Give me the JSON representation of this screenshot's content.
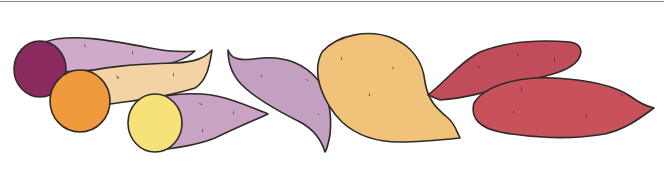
{
  "illustration": {
    "subject": "Assorted sweet potatoes watercolor illustration",
    "items": [
      {
        "name": "purple-sweet-potato-cut",
        "flesh": "purple"
      },
      {
        "name": "orange-sweet-potato-cut",
        "flesh": "orange"
      },
      {
        "name": "yellow-sweet-potato-cut",
        "flesh": "yellow"
      },
      {
        "name": "lavender-sweet-potato-whole"
      },
      {
        "name": "yellow-potato-whole"
      },
      {
        "name": "red-sweet-potato-whole-back"
      },
      {
        "name": "red-sweet-potato-whole-front"
      }
    ]
  },
  "colors": {
    "purple_flesh": "#8b2a5e",
    "purple_skin": "#c9a5c6",
    "orange_flesh": "#ee9a3d",
    "tan_skin": "#f4d4a6",
    "yellow_flesh": "#f7e27a",
    "lavender_skin": "#bf9bbd",
    "yellow_potato": "#f0c27a",
    "red_skin": "#c24d5a",
    "outline": "#2e2a26",
    "rule": "#8a8a8a"
  }
}
